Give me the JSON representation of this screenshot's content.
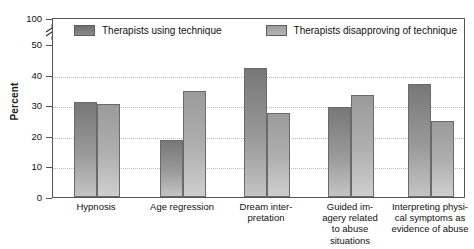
{
  "chart_data": {
    "type": "bar",
    "title": "",
    "xlabel": "",
    "ylabel": "Percent",
    "ylim": [
      0,
      50
    ],
    "grid": true,
    "axis_break": "y-axis broken between 50 and 100",
    "legend_position": "top-inside",
    "yticks": [
      {
        "value": 100,
        "label": "100"
      },
      {
        "value": 50,
        "label": "50"
      },
      {
        "value": 40,
        "label": "40"
      },
      {
        "value": 30,
        "label": "30"
      },
      {
        "value": 20,
        "label": "20"
      },
      {
        "value": 10,
        "label": "10"
      },
      {
        "value": 0,
        "label": "0"
      }
    ],
    "categories": [
      "Hypnosis",
      "Age regression",
      "Dream inter-\npretation",
      "Guided im-\nagery related\nto abuse\nsituations",
      "Interpreting physi-\ncal symptoms as\nevidence of abuse"
    ],
    "series": [
      {
        "name": "Therapists using technique",
        "color": "#8a8a8a",
        "values": [
          31,
          18.5,
          42,
          29.5,
          37
        ]
      },
      {
        "name": "Therapists disapproving of technique",
        "color": "#b0b0b0",
        "values": [
          30.5,
          34.5,
          27.5,
          33.5,
          25
        ]
      }
    ]
  },
  "legend": {
    "items": [
      {
        "label": "Therapists using technique"
      },
      {
        "label": "Therapists disapproving of technique"
      }
    ]
  },
  "axis": {
    "y_title": "Percent"
  }
}
